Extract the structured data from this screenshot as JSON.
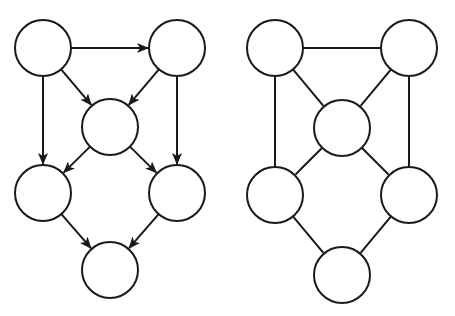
{
  "diagram": {
    "title": "",
    "node_radius": 28,
    "stroke_color": "#1a1a1a",
    "fill_color": "#ffffff",
    "graphs": [
      {
        "name": "directed-graph",
        "directed": true,
        "nodes": [
          {
            "id": "A",
            "x": 43,
            "y": 48
          },
          {
            "id": "B",
            "x": 177,
            "y": 48
          },
          {
            "id": "C",
            "x": 110,
            "y": 127
          },
          {
            "id": "D",
            "x": 43,
            "y": 193
          },
          {
            "id": "E",
            "x": 177,
            "y": 193
          },
          {
            "id": "F",
            "x": 110,
            "y": 270
          }
        ],
        "edges": [
          {
            "from": "A",
            "to": "B"
          },
          {
            "from": "A",
            "to": "C"
          },
          {
            "from": "B",
            "to": "C"
          },
          {
            "from": "A",
            "to": "D"
          },
          {
            "from": "B",
            "to": "E"
          },
          {
            "from": "C",
            "to": "D"
          },
          {
            "from": "C",
            "to": "E"
          },
          {
            "from": "D",
            "to": "F"
          },
          {
            "from": "E",
            "to": "F"
          }
        ]
      },
      {
        "name": "undirected-graph",
        "directed": false,
        "nodes": [
          {
            "id": "A",
            "x": 275,
            "y": 48
          },
          {
            "id": "B",
            "x": 409,
            "y": 48
          },
          {
            "id": "C",
            "x": 342,
            "y": 128
          },
          {
            "id": "D",
            "x": 275,
            "y": 195
          },
          {
            "id": "E",
            "x": 409,
            "y": 195
          },
          {
            "id": "F",
            "x": 342,
            "y": 275
          }
        ],
        "edges": [
          {
            "from": "A",
            "to": "B"
          },
          {
            "from": "A",
            "to": "C"
          },
          {
            "from": "B",
            "to": "C"
          },
          {
            "from": "A",
            "to": "D"
          },
          {
            "from": "B",
            "to": "E"
          },
          {
            "from": "C",
            "to": "D"
          },
          {
            "from": "C",
            "to": "E"
          },
          {
            "from": "D",
            "to": "F"
          },
          {
            "from": "E",
            "to": "F"
          }
        ]
      }
    ]
  }
}
